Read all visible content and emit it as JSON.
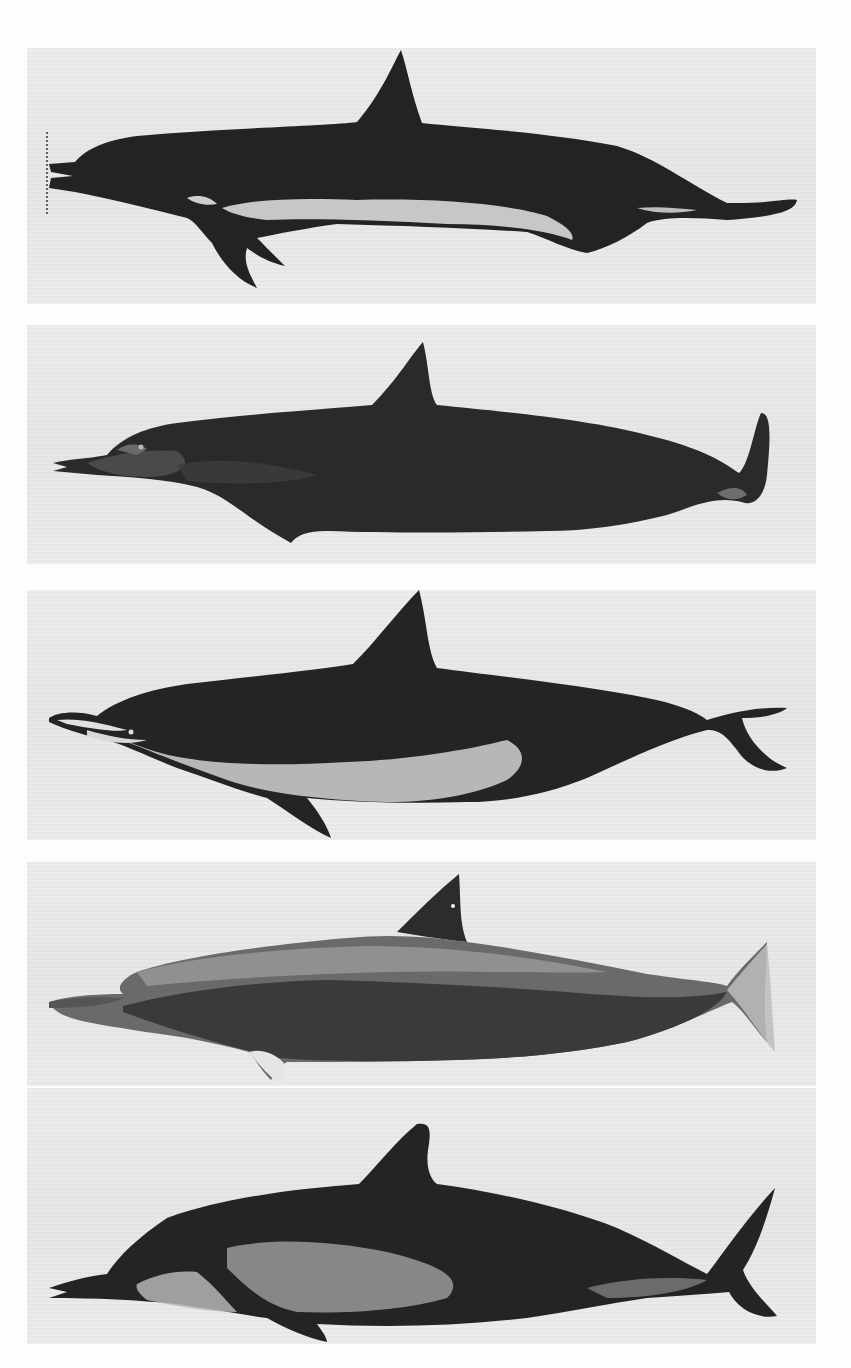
{
  "figure": {
    "type": "photographic plate",
    "panel_count": 5,
    "colors": {
      "background": "#fdfdfd",
      "panel": "#e9e9e9",
      "body_dark": "#262626",
      "body_mid": "#5a5a5a",
      "belly_light": "#c8c8c8"
    },
    "panels": [
      {
        "index": 1,
        "label": "dolphin-specimen-1",
        "orientation": "head right, rostrum right"
      },
      {
        "index": 2,
        "label": "dolphin-specimen-2",
        "orientation": "head left"
      },
      {
        "index": 3,
        "label": "dolphin-specimen-3",
        "orientation": "head left"
      },
      {
        "index": 4,
        "label": "dolphin-specimen-4",
        "orientation": "head left"
      },
      {
        "index": 5,
        "label": "dolphin-specimen-5",
        "orientation": "head left"
      }
    ],
    "caption": {
      "text": "",
      "note": "caption line cut off at bottom edge; illegible"
    }
  }
}
